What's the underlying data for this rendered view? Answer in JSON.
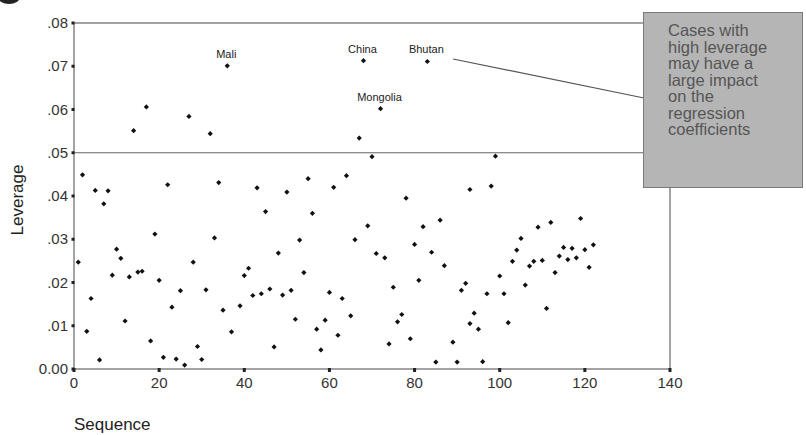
{
  "callout": {
    "text": "Cases with\nhigh leverage\nmay have a\nlarge impact\non the\nregression\ncoefficients"
  },
  "chart_data": {
    "type": "scatter",
    "title": "",
    "xlabel": "Sequence",
    "ylabel": "Leverage",
    "xlim": [
      0,
      140
    ],
    "ylim": [
      0,
      0.08
    ],
    "xticks": [
      "0",
      "20",
      "40",
      "60",
      "80",
      "100",
      "120",
      "140"
    ],
    "yticks": [
      "0.00",
      ".01",
      ".02",
      ".03",
      ".04",
      ".05",
      ".06",
      ".07",
      ".08"
    ],
    "grid": false,
    "reference_line": {
      "y": 0.05
    },
    "annotations": [
      {
        "label": "Mali",
        "x": 36,
        "y": 0.0701
      },
      {
        "label": "China",
        "x": 68,
        "y": 0.0713
      },
      {
        "label": "Bhutan",
        "x": 83,
        "y": 0.0711
      },
      {
        "label": "Mongolia",
        "x": 72,
        "y": 0.0602
      }
    ],
    "x": [
      1,
      2,
      3,
      4,
      5,
      6,
      7,
      8,
      9,
      10,
      11,
      12,
      13,
      14,
      15,
      16,
      17,
      18,
      19,
      20,
      21,
      22,
      23,
      24,
      25,
      26,
      27,
      28,
      29,
      30,
      31,
      32,
      33,
      34,
      35,
      36,
      37,
      39,
      40,
      41,
      42,
      43,
      44,
      45,
      46,
      47,
      48,
      49,
      50,
      51,
      52,
      53,
      54,
      55,
      56,
      57,
      58,
      59,
      60,
      61,
      62,
      63,
      64,
      65,
      66,
      67,
      68,
      69,
      70,
      71,
      72,
      73,
      74,
      75,
      76,
      77,
      78,
      79,
      80,
      81,
      82,
      83,
      84,
      85,
      86,
      87,
      89,
      90,
      91,
      92,
      93,
      93,
      94,
      95,
      96,
      97,
      98,
      99,
      100,
      101,
      102,
      103,
      104,
      105,
      106,
      107,
      108,
      109,
      110,
      111,
      112,
      113,
      114,
      115,
      116,
      117,
      118,
      119,
      120,
      121,
      122
    ],
    "y": [
      0.0247,
      0.0449,
      0.0087,
      0.0163,
      0.0413,
      0.0021,
      0.0382,
      0.0412,
      0.0217,
      0.0277,
      0.0256,
      0.0111,
      0.0213,
      0.0551,
      0.0224,
      0.0226,
      0.0606,
      0.0065,
      0.0312,
      0.0205,
      0.0027,
      0.0426,
      0.0143,
      0.0023,
      0.0181,
      0.0009,
      0.0584,
      0.0247,
      0.0052,
      0.0022,
      0.0183,
      0.0544,
      0.0303,
      0.0431,
      0.0136,
      0.0701,
      0.0086,
      0.0146,
      0.0216,
      0.0233,
      0.017,
      0.0419,
      0.0174,
      0.0364,
      0.0185,
      0.0051,
      0.0268,
      0.0171,
      0.0409,
      0.0182,
      0.0115,
      0.0298,
      0.0223,
      0.044,
      0.036,
      0.0092,
      0.0044,
      0.0113,
      0.0177,
      0.042,
      0.0078,
      0.0163,
      0.0447,
      0.0123,
      0.0299,
      0.0534,
      0.0713,
      0.0331,
      0.0491,
      0.0267,
      0.0602,
      0.0257,
      0.0058,
      0.0189,
      0.0109,
      0.0126,
      0.0395,
      0.007,
      0.0288,
      0.0205,
      0.0329,
      0.0711,
      0.027,
      0.0016,
      0.0344,
      0.0239,
      0.0062,
      0.0016,
      0.0182,
      0.0198,
      0.0105,
      0.0415,
      0.0129,
      0.0092,
      0.0017,
      0.0174,
      0.0423,
      0.0492,
      0.0215,
      0.0174,
      0.0107,
      0.0249,
      0.0275,
      0.0302,
      0.0194,
      0.0238,
      0.0249,
      0.0328,
      0.0251,
      0.014,
      0.0339,
      0.0223,
      0.0261,
      0.0281,
      0.0253,
      0.0279,
      0.0257,
      0.0348,
      0.0276,
      0.0235,
      0.0287
    ]
  }
}
